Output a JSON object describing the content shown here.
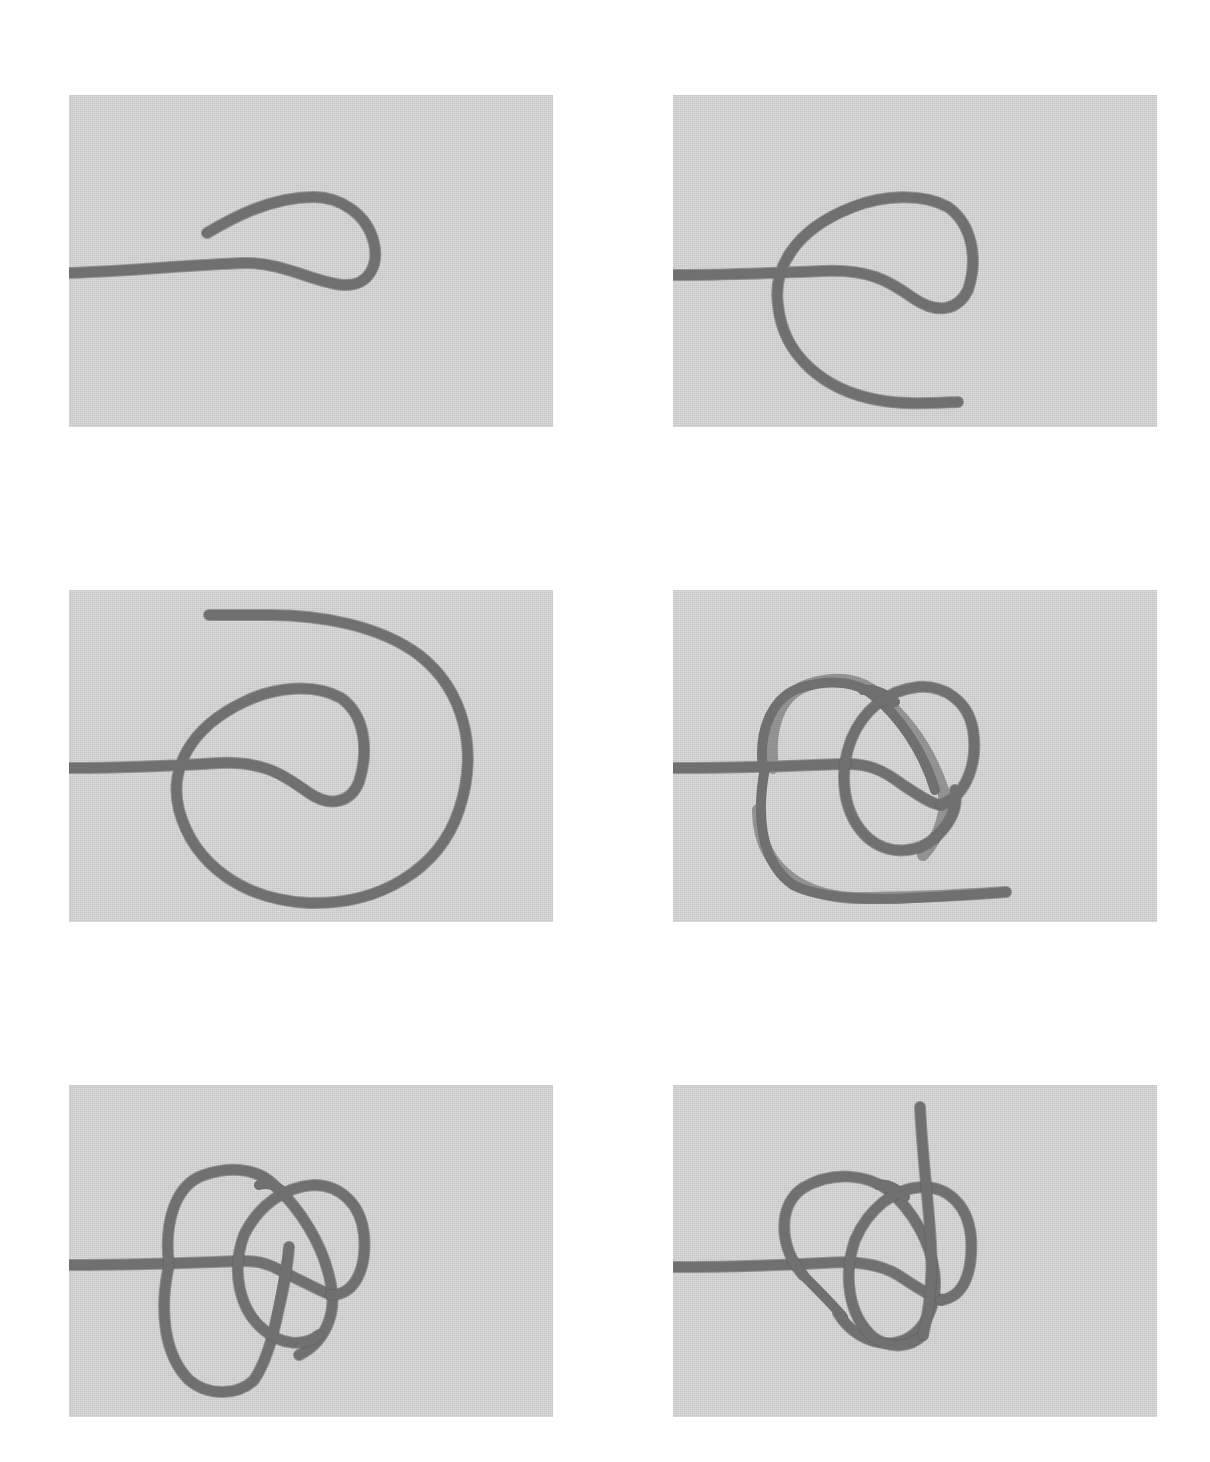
{
  "figure": {
    "type": "knot-tying step sequence",
    "layout": {
      "rows": 3,
      "columns": 2
    },
    "colors": {
      "page_background": "#ffffff",
      "panel_background": "#d4d4d4",
      "rope": "#707070"
    },
    "panels": [
      {
        "step": 1,
        "description": "Rope laid horizontally from left, working end bent back into a hairpin loop pointing left"
      },
      {
        "step": 2,
        "description": "Working end brought down around and under the standing part forming a loop, tail pointing right at bottom"
      },
      {
        "step": 3,
        "description": "Working end taken in a large clockwise circle around the first loop, tail ending at top"
      },
      {
        "step": 4,
        "description": "Working end passed through forming overlapping loops, tail exiting lower right"
      },
      {
        "step": 5,
        "description": "Working end woven through the overlapping loops, tail emerging in center"
      },
      {
        "step": 6,
        "description": "Knot dressed with tail pointing straight up from the center of the interlaced loops"
      }
    ]
  }
}
